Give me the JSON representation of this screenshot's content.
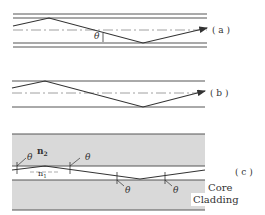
{
  "panels": {
    "a": {
      "label": "( a )",
      "angle_symbol": "θ"
    },
    "b": {
      "label": "( b )"
    },
    "c": {
      "label": "( c )",
      "n_cladding": "n",
      "n_cladding_sub": "2",
      "n_core": "n",
      "n_core_sub": "1",
      "angle_symbol": "θ",
      "core_label": "Core",
      "cladding_label": "Cladding"
    }
  },
  "colors": {
    "line": "#444444",
    "cladding_fill": "#d9d9d9",
    "background": "#ffffff"
  }
}
